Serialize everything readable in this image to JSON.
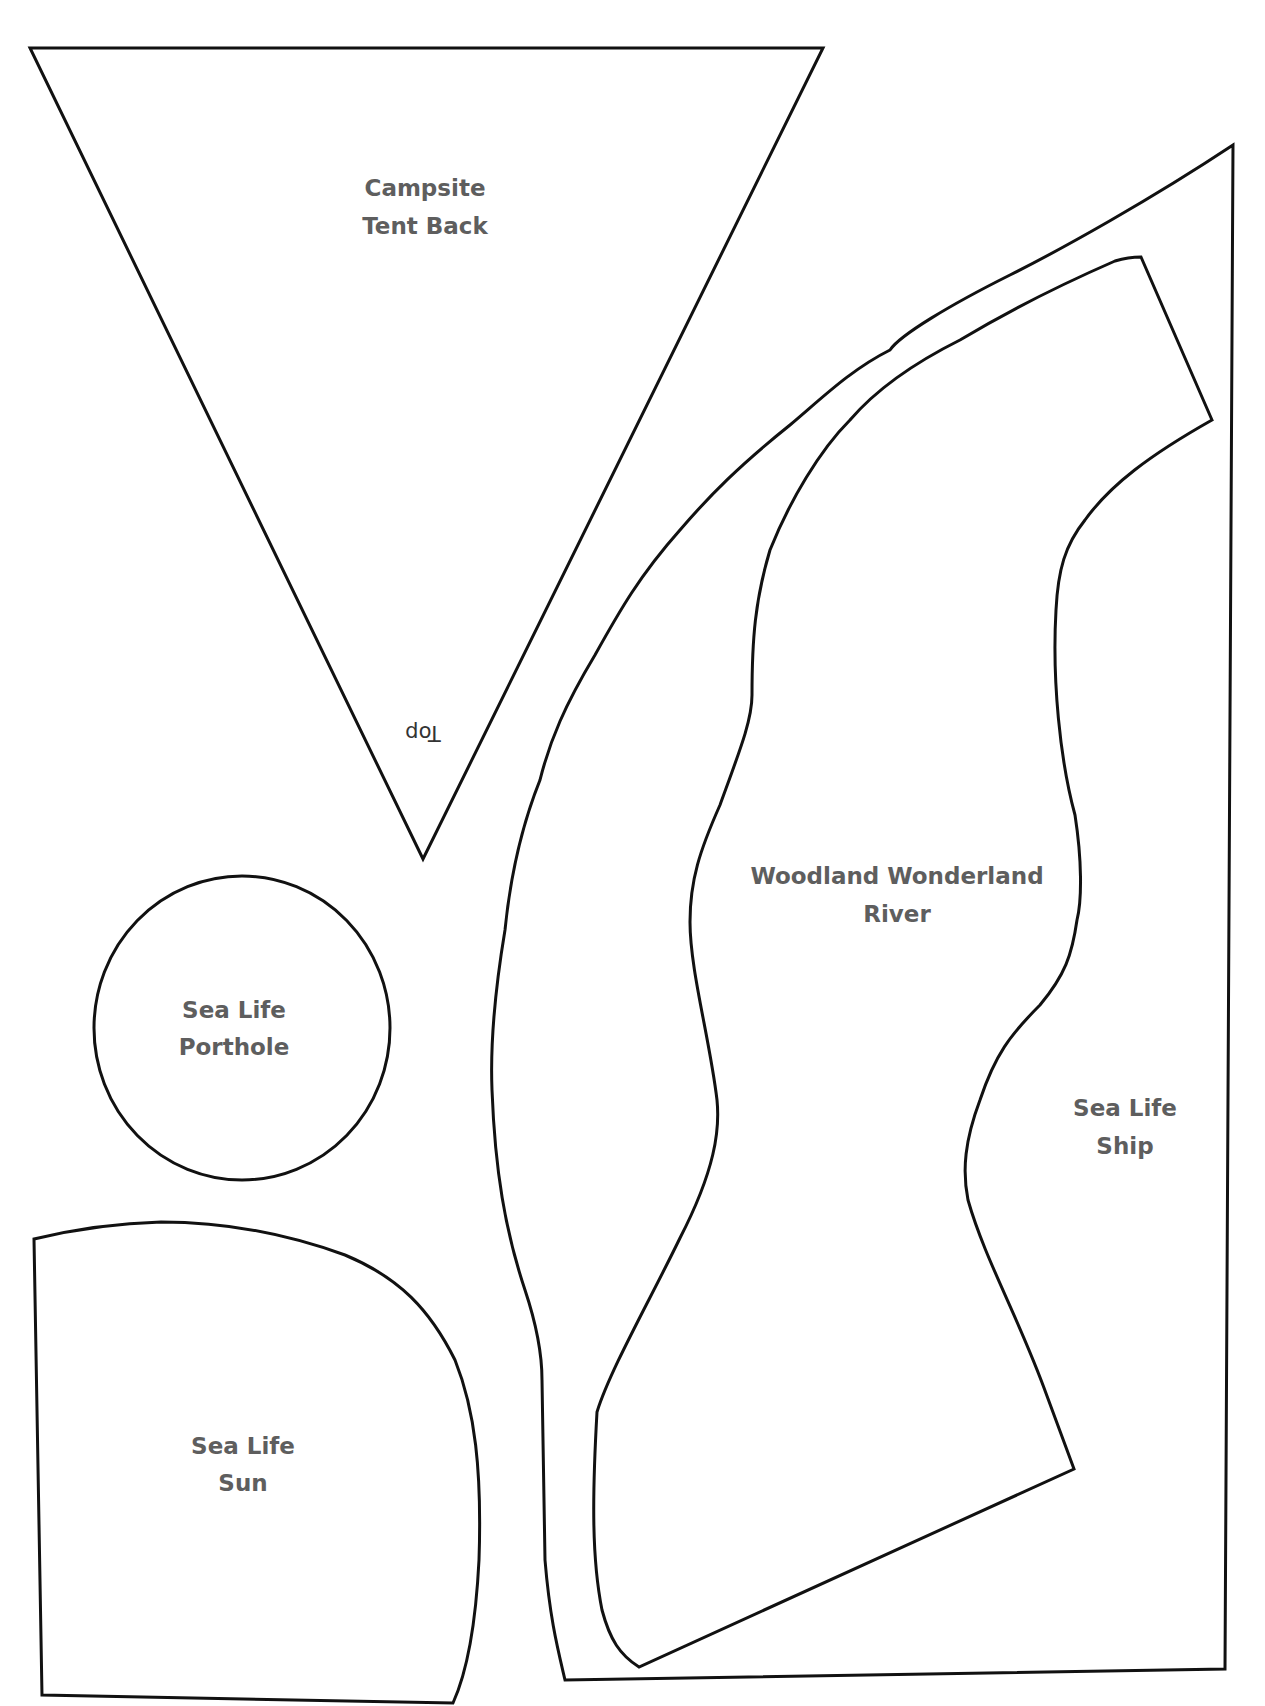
{
  "page": {
    "pieces": {
      "tent": {
        "line1": "Campsite",
        "line2": "Tent Back",
        "orientation_label": "Top"
      },
      "river": {
        "line1": "Woodland Wonderland",
        "line2": "River"
      },
      "porthole": {
        "line1": "Sea Life",
        "line2": "Porthole"
      },
      "sun": {
        "line1": "Sea Life",
        "line2": "Sun"
      },
      "ship": {
        "line1": "Sea Life",
        "line2": "Ship"
      }
    },
    "colors": {
      "outline": "#111111",
      "label": "#5e5e5e",
      "background": "#ffffff"
    }
  }
}
